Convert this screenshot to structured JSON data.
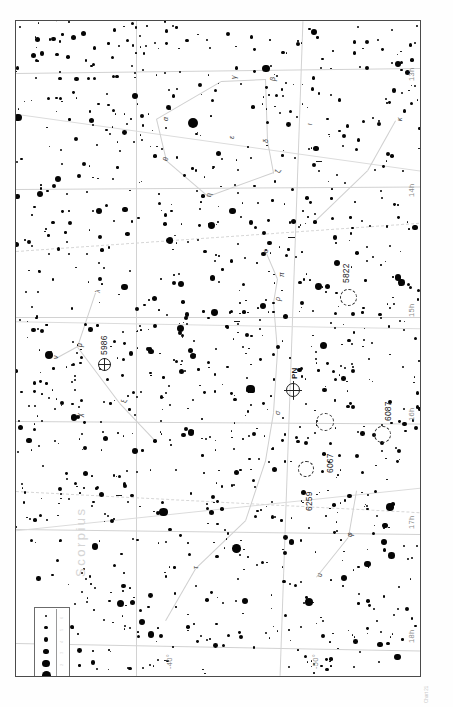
{
  "document": {
    "type": "star-atlas-chart",
    "title": "Star Atlas Chart",
    "orientation": "landscape chart printed rotated 90 degrees on a portrait page"
  },
  "chart_data": {
    "type": "scatter",
    "xlabel": "Right Ascension",
    "ylabel": "Declination",
    "xlim": [
      "13h",
      "18h"
    ],
    "ylim": [
      "-30°",
      "-55°"
    ],
    "grid": true,
    "legend": "magnitude scale box, lower left",
    "ra_ticks": [
      "13h",
      "14h",
      "15h",
      "16h",
      "17h",
      "18h"
    ],
    "dec_ticks": [
      "-40°",
      "-50°"
    ],
    "magnitude_legend": {
      "label": "Magnitudes",
      "values": [
        "0",
        "1",
        "2",
        "3",
        "4",
        "5",
        "6"
      ],
      "dot_sizes_px": [
        11,
        9,
        7.4,
        5.8,
        4.4,
        3.2,
        2.2
      ]
    },
    "deep_sky_objects": [
      {
        "name": "5822",
        "kind": "open-cluster",
        "x": 330,
        "y": 282
      },
      {
        "name": "5986",
        "kind": "globular-cluster",
        "x": 95,
        "y": 346
      },
      {
        "name": "PN",
        "kind": "planetary-nebula",
        "x": 290,
        "y": 378
      },
      {
        "name": "6067",
        "kind": "open-cluster",
        "x": 325,
        "y": 418
      },
      {
        "name": "6087",
        "kind": "open-cluster",
        "x": 383,
        "y": 425
      },
      {
        "name": "6259",
        "kind": "open-cluster",
        "x": 308,
        "y": 468
      }
    ],
    "constellation_names": [
      "Scorpius"
    ],
    "star_count_plotted": 1180
  },
  "axes": {
    "ra_labels": [
      {
        "text": "13h",
        "x": 412,
        "y": 52
      },
      {
        "text": "14h",
        "x": 412,
        "y": 168
      },
      {
        "text": "15h",
        "x": 412,
        "y": 296
      },
      {
        "text": "16h",
        "x": 412,
        "y": 400
      },
      {
        "text": "17h",
        "x": 412,
        "y": 508
      },
      {
        "text": "18h",
        "x": 412,
        "y": 622
      }
    ],
    "dec_labels": [
      {
        "text": "-40°",
        "x": 168,
        "y": 664
      },
      {
        "text": "-50°",
        "x": 312,
        "y": 664
      }
    ]
  },
  "objects": {
    "ngc_5822": {
      "label": "5822"
    },
    "ngc_5986": {
      "label": "5986"
    },
    "pn_marker": {
      "label": "PN"
    },
    "ngc_6067": {
      "label": "6067"
    },
    "ngc_6087": {
      "label": "6087"
    },
    "ngc_6259": {
      "label": "6259"
    }
  },
  "constellation": {
    "scorpius": {
      "label": "Scorpius"
    }
  },
  "legend": {
    "mag_labels": [
      "0",
      "1",
      "2",
      "3",
      "4",
      "5",
      "6"
    ]
  },
  "margin": {
    "caption": "Chart 21"
  },
  "greek_labels": [
    {
      "t": "α",
      "x": 146,
      "y": 100
    },
    {
      "t": "β",
      "x": 253,
      "y": 60
    },
    {
      "t": "γ",
      "x": 214,
      "y": 58
    },
    {
      "t": "δ",
      "x": 246,
      "y": 122
    },
    {
      "t": "ε",
      "x": 212,
      "y": 118
    },
    {
      "t": "ζ",
      "x": 258,
      "y": 152
    },
    {
      "t": "η",
      "x": 189,
      "y": 176
    },
    {
      "t": "θ",
      "x": 146,
      "y": 140
    },
    {
      "t": "ι",
      "x": 290,
      "y": 104
    },
    {
      "t": "κ",
      "x": 380,
      "y": 100
    },
    {
      "t": "λ",
      "x": 78,
      "y": 272
    },
    {
      "t": "μ",
      "x": 60,
      "y": 326
    },
    {
      "t": "ν",
      "x": 36,
      "y": 338
    },
    {
      "t": "ξ",
      "x": 104,
      "y": 382
    },
    {
      "t": "ο",
      "x": 246,
      "y": 232
    },
    {
      "t": "π",
      "x": 262,
      "y": 256
    },
    {
      "t": "ρ",
      "x": 258,
      "y": 280
    },
    {
      "t": "σ",
      "x": 258,
      "y": 394
    },
    {
      "t": "τ",
      "x": 176,
      "y": 548
    },
    {
      "t": "υ",
      "x": 300,
      "y": 556
    },
    {
      "t": "φ",
      "x": 330,
      "y": 516
    },
    {
      "t": "χ",
      "x": 60,
      "y": 396
    },
    {
      "t": "ψ",
      "x": 188,
      "y": 674
    },
    {
      "t": "ω",
      "x": 160,
      "y": 662
    }
  ]
}
